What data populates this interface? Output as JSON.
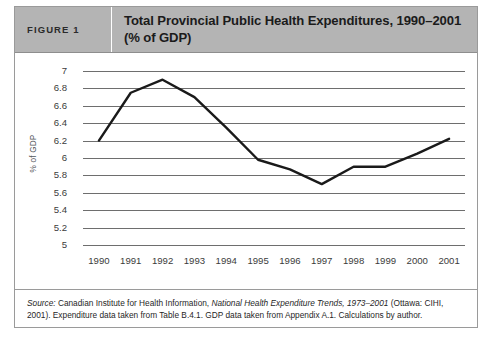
{
  "figure": {
    "number_label": "FIGURE 1",
    "title": "Total Provincial Public Health Expenditures, 1990–2001 (% of GDP)"
  },
  "source_note": {
    "label": "Source:",
    "text_before_italic": " Canadian Institute for Health Information, ",
    "italic_title": "National Health Expenditure Trends, 1973–2001",
    "text_after_italic": " (Ottawa: CIHI, 2001). Expenditure data taken from Table B.4.1. GDP data taken from Appendix A.1. Calculations by author."
  },
  "colors": {
    "header_background": "#b4b4b4",
    "border": "#9a9a9a",
    "gridline": "#6e6e6e",
    "series_line": "#1a1a1a"
  },
  "chart_data": {
    "type": "line",
    "title": "Total Provincial Public Health Expenditures, 1990–2001 (% of GDP)",
    "xlabel": "",
    "ylabel": "% of GDP",
    "categories": [
      "1990",
      "1991",
      "1992",
      "1993",
      "1994",
      "1995",
      "1996",
      "1997",
      "1998",
      "1999",
      "2000",
      "2001"
    ],
    "values": [
      6.2,
      6.75,
      6.9,
      6.7,
      6.35,
      5.98,
      5.87,
      5.7,
      5.9,
      5.9,
      6.05,
      6.22
    ],
    "x_tick_labels": [
      "1990",
      "1991",
      "1992",
      "1993",
      "1994",
      "1995",
      "1996",
      "1997",
      "1998",
      "1999",
      "2000",
      "2001"
    ],
    "y_tick_labels": [
      "7",
      "6.8",
      "6.6",
      "6.4",
      "6.2",
      "6",
      "5.8",
      "5.6",
      "5.4",
      "5.2",
      "5"
    ],
    "y_tick_values": [
      7,
      6.8,
      6.6,
      6.4,
      6.2,
      6,
      5.8,
      5.6,
      5.4,
      5.2,
      5
    ],
    "ylim": [
      5,
      7
    ],
    "grid": true,
    "legend": false,
    "series": [
      {
        "name": "Total provincial public health expenditures (% of GDP)",
        "values": [
          6.2,
          6.75,
          6.9,
          6.7,
          6.35,
          5.98,
          5.87,
          5.7,
          5.9,
          5.9,
          6.05,
          6.22
        ]
      }
    ]
  }
}
